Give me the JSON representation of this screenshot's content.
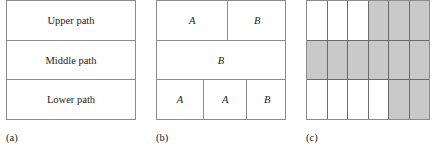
{
  "figure": {
    "panels": [
      {
        "id": "a",
        "caption": "(a)",
        "type": "stacked-bands",
        "bands": [
          {
            "label": "Upper path"
          },
          {
            "label": "Middle path"
          },
          {
            "label": "Lower path"
          }
        ]
      },
      {
        "id": "b",
        "caption": "(b)",
        "type": "partition",
        "rows": [
          {
            "cells": [
              {
                "label": "A",
                "width_pct": 55
              },
              {
                "label": "B",
                "width_pct": 45
              }
            ]
          },
          {
            "cells": [
              {
                "label": "B",
                "width_pct": 100
              }
            ]
          },
          {
            "cells": [
              {
                "label": "A",
                "width_pct": 36
              },
              {
                "label": "A",
                "width_pct": 33
              },
              {
                "label": "B",
                "width_pct": 31
              }
            ]
          }
        ]
      },
      {
        "id": "c",
        "caption": "(c)",
        "type": "shaded-grid",
        "columns": 6,
        "rows": 3,
        "shade_color": "#c9c9c9",
        "plain_color": "#ffffff",
        "cells": [
          [
            0,
            0,
            0,
            1,
            1,
            1
          ],
          [
            1,
            1,
            1,
            1,
            1,
            1
          ],
          [
            0,
            0,
            0,
            0,
            1,
            1
          ]
        ]
      }
    ]
  }
}
